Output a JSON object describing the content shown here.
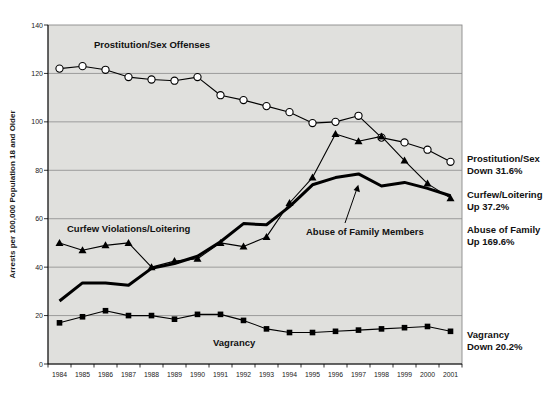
{
  "chart_data": {
    "type": "line",
    "title": "",
    "xlabel": "",
    "ylabel": "Arrests per 100,000 Population 18 and Older",
    "ylim": [
      0,
      140
    ],
    "ytick_interval": 20,
    "grid": true,
    "legend_position": "none",
    "plot_bg_color": "#e0e0dd",
    "gridline_color": "#8a8a8a",
    "line_color": "#000000",
    "x": [
      "1984",
      "1985",
      "1986",
      "1987",
      "1988",
      "1989",
      "1990",
      "1991",
      "1992",
      "1993",
      "1994",
      "1995",
      "1996",
      "1997",
      "1998",
      "1999",
      "2000",
      "2001"
    ],
    "series": [
      {
        "name": "Prostitution/Sex Offenses",
        "marker": "open-circle",
        "line_width": 1.1,
        "values": [
          122,
          123,
          121.5,
          118.5,
          117.5,
          117,
          118.5,
          111,
          109,
          106.5,
          104,
          99.5,
          100,
          102.5,
          93.5,
          91.5,
          88.5,
          83.5
        ]
      },
      {
        "name": "Curfew Violations/Loitering",
        "marker": "filled-triangle",
        "line_width": 1.1,
        "values": [
          50,
          47,
          49,
          50,
          40,
          42.5,
          43.5,
          50,
          48.5,
          52.5,
          66.5,
          77,
          95,
          92,
          94,
          84,
          74.5,
          68.5
        ]
      },
      {
        "name": "Abuse of Family Members",
        "marker": "none",
        "line_width": 3,
        "values": [
          26,
          33.5,
          33.5,
          32.5,
          39.5,
          41.5,
          44.5,
          50.5,
          58,
          57.5,
          65,
          74,
          77,
          78.5,
          73.5,
          75,
          72.5,
          69.5
        ]
      },
      {
        "name": "Vagrancy",
        "marker": "filled-square",
        "line_width": 1.1,
        "values": [
          17,
          19.5,
          22,
          20,
          20,
          18.5,
          20.5,
          20.5,
          18,
          14.5,
          13,
          13,
          13.5,
          14,
          14.5,
          15,
          15.5,
          13.5
        ]
      }
    ],
    "inline_labels": {
      "prostitution": "Prostitution/Sex Offenses",
      "curfew": "Curfew Violations/Loitering",
      "abuse": "Abuse of Family Members",
      "vagrancy": "Vagrancy"
    },
    "right_annotations": [
      {
        "line1": "Prostitution/Sex",
        "line2": "Down 31.6%"
      },
      {
        "line1": "Curfew/Loitering",
        "line2": "Up 37.2%"
      },
      {
        "line1": "Abuse of Family",
        "line2": "Up 169.6%"
      },
      {
        "line1": "Vagrancy",
        "line2": "Down 20.2%"
      }
    ]
  }
}
